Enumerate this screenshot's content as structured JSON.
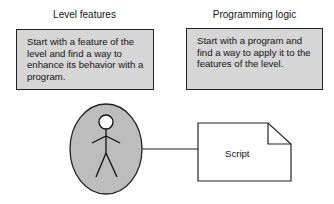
{
  "columns": [
    {
      "heading": "Level features",
      "text": "Start with a feature of the level and find a way to enhance its behavior with a program."
    },
    {
      "heading": "Programming logic",
      "text": "Start with a program and find a way to apply it to the features of the level."
    }
  ],
  "diagram": {
    "actor_icon": "stick-figure-icon",
    "document_label": "Script",
    "colors": {
      "box_fill": "#d6d6d6",
      "ellipse_fill": "#bdbdbd",
      "stroke": "#222222"
    }
  }
}
